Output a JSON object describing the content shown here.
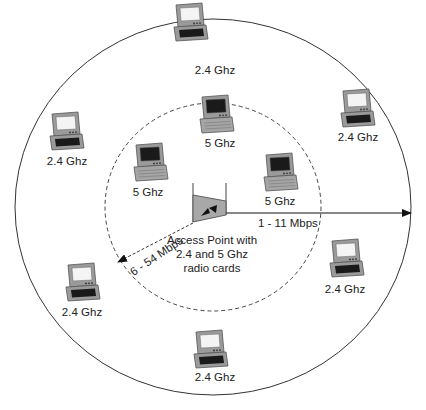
{
  "diagram": {
    "type": "wireless-coverage",
    "outer_range": {
      "label": "1 - 11 Mbps",
      "band": "2.4 Ghz"
    },
    "inner_range": {
      "label": "6 - 54 Mbps",
      "band": "5 Ghz"
    },
    "access_point": {
      "line1": "Access Point with",
      "line2": "2.4 and 5 Ghz",
      "line3": "radio cards"
    },
    "clients": [
      {
        "id": "top",
        "label": "2.4 Ghz",
        "band": "2.4"
      },
      {
        "id": "upper-left",
        "label": "2.4 Ghz",
        "band": "2.4"
      },
      {
        "id": "upper-right",
        "label": "2.4 Ghz",
        "band": "2.4"
      },
      {
        "id": "inner-top",
        "label": "5 Ghz",
        "band": "5"
      },
      {
        "id": "inner-left",
        "label": "5 Ghz",
        "band": "5"
      },
      {
        "id": "inner-right",
        "label": "5 Ghz",
        "band": "5"
      },
      {
        "id": "lower-left",
        "label": "2.4 Ghz",
        "band": "2.4"
      },
      {
        "id": "lower-right",
        "label": "2.4 Ghz",
        "band": "2.4"
      },
      {
        "id": "bottom",
        "label": "2.4 Ghz",
        "band": "2.4"
      }
    ],
    "colors": {
      "line": "#333333",
      "laptop_body": "#9a9a9a",
      "screen_2_4": "#f4f4f4",
      "screen_5": "#1a1a1a",
      "ap_fill": "#a8a8a8"
    }
  }
}
